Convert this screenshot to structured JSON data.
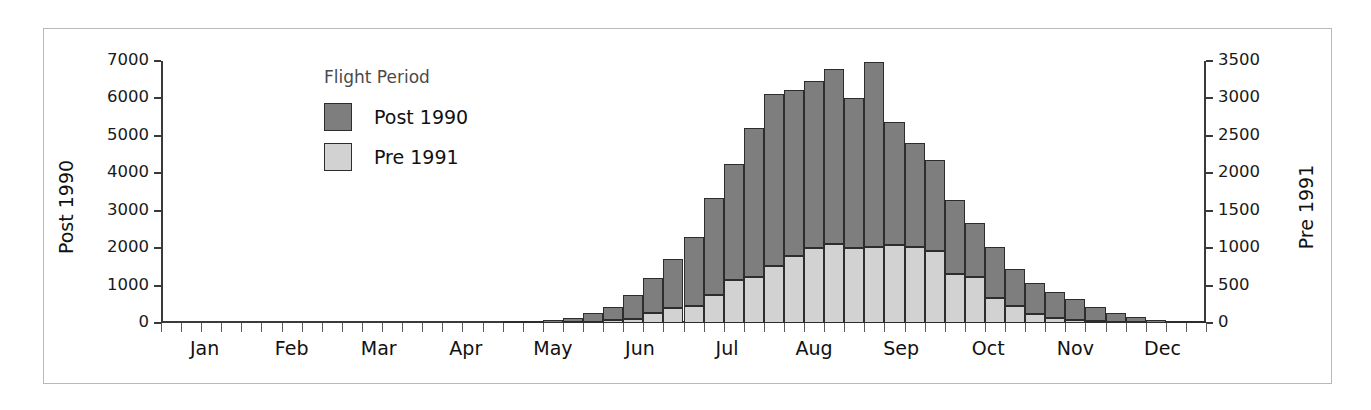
{
  "chart_data": {
    "type": "bar",
    "title": "",
    "subtitle": "",
    "stacked": true,
    "grid": false,
    "xlabel": "",
    "ylabel": "Post 1990",
    "y2label": "Pre 1991",
    "ylim": [
      0,
      7000
    ],
    "y2lim": [
      0,
      3500
    ],
    "yticks": [
      "0",
      "1000",
      "2000",
      "3000",
      "4000",
      "5000",
      "6000",
      "7000"
    ],
    "ytick_values": [
      0,
      1000,
      2000,
      3000,
      4000,
      5000,
      6000,
      7000
    ],
    "y2ticks": [
      "0",
      "500",
      "1000",
      "1500",
      "2000",
      "2500",
      "3000",
      "3500"
    ],
    "y2tick_values": [
      0,
      500,
      1000,
      1500,
      2000,
      2500,
      3000,
      3500
    ],
    "xtick_labels": [
      "Jan",
      "Feb",
      "Mar",
      "Apr",
      "May",
      "Jun",
      "Jul",
      "Aug",
      "Sep",
      "Oct",
      "Nov",
      "Dec"
    ],
    "legend_title": "Flight Period",
    "legend_position": "inside-top-left",
    "legend": [
      {
        "name": "Post 1990",
        "color": "#7e7e7e"
      },
      {
        "name": "Pre 1991",
        "color": "#d2d2d2"
      }
    ],
    "bin_count": 52,
    "bins_per_month": 4.333,
    "note": "x axis is half-month/weekly bins across the year; bar values read against left axis (Post 1990) and right axis (Pre 1991)",
    "series": [
      {
        "name": "Pre 1991",
        "axis": "right",
        "color": "#d2d2d2",
        "values": [
          0,
          0,
          0,
          0,
          0,
          0,
          0,
          0,
          0,
          0,
          0,
          0,
          0,
          0,
          0,
          0,
          0,
          0,
          0,
          5,
          10,
          20,
          40,
          60,
          130,
          200,
          230,
          370,
          580,
          620,
          760,
          900,
          1000,
          1050,
          1000,
          1020,
          1040,
          1020,
          960,
          660,
          610,
          340,
          230,
          120,
          70,
          40,
          25,
          15,
          8,
          4,
          2,
          0
        ]
      },
      {
        "name": "Post 1990",
        "axis": "left",
        "color": "#7e7e7e",
        "values": [
          0,
          0,
          0,
          0,
          0,
          0,
          0,
          0,
          0,
          0,
          0,
          0,
          0,
          0,
          0,
          0,
          0,
          20,
          40,
          60,
          120,
          220,
          360,
          620,
          940,
          1300,
          1840,
          2600,
          3100,
          3960,
          4600,
          4420,
          4460,
          4680,
          4020,
          4940,
          3300,
          2760,
          2440,
          1960,
          1440,
          1340,
          980,
          840,
          700,
          560,
          390,
          250,
          140,
          80,
          40,
          20
        ]
      }
    ],
    "totals_left_axis": [
      0,
      0,
      0,
      0,
      0,
      0,
      0,
      0,
      0,
      0,
      0,
      0,
      0,
      0,
      0,
      0,
      0,
      20,
      40,
      70,
      140,
      260,
      440,
      740,
      1200,
      1700,
      2300,
      3340,
      4260,
      5200,
      6120,
      6220,
      6460,
      6780,
      6020,
      6980,
      5380,
      4800,
      4360,
      3280,
      2660,
      2020,
      1440,
      1080,
      840,
      640,
      440,
      280,
      156,
      88,
      44,
      20
    ]
  }
}
